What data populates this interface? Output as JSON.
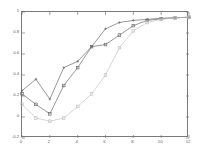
{
  "chart_data": {
    "type": "line",
    "title": "",
    "subtitle": "",
    "xlabel": "",
    "ylabel": "",
    "xlim": [
      0,
      12
    ],
    "ylim": [
      -0.2,
      1
    ],
    "grid": false,
    "legend": "none",
    "background_color": "#ffffff",
    "frame_color": "#7a7a7a",
    "xticks": [
      0,
      2,
      4,
      6,
      8,
      10,
      12
    ],
    "xtick_labels": [
      "0",
      "2",
      "4",
      "6",
      "8",
      "10",
      "12"
    ],
    "yticks": [
      -0.2,
      0,
      0.2,
      0.4,
      0.6,
      0.8,
      1
    ],
    "ytick_labels": [
      "-0.2",
      "0",
      "0.2",
      "0.4",
      "0.6",
      "0.8",
      "1"
    ],
    "x": [
      0,
      1,
      2,
      3,
      4,
      5,
      6,
      7,
      8,
      9,
      10,
      11,
      12
    ],
    "series": [
      {
        "name": "series-1",
        "color": "#6b6b6b",
        "marker": "plus",
        "marker_size": 2.6,
        "line_width": 0.7,
        "values": [
          0.25,
          0.36,
          0.17,
          0.47,
          0.53,
          0.67,
          0.84,
          0.9,
          0.92,
          0.93,
          0.94,
          0.945,
          0.95
        ]
      },
      {
        "name": "series-2",
        "color": "#6b6b6b",
        "marker": "square",
        "marker_size": 2.6,
        "line_width": 0.7,
        "values": [
          0.22,
          0.12,
          0.03,
          0.3,
          0.47,
          0.67,
          0.69,
          0.78,
          0.87,
          0.92,
          0.935,
          0.945,
          0.95
        ]
      },
      {
        "name": "series-3",
        "color": "#c4c4c4",
        "marker": "square",
        "marker_size": 2.6,
        "line_width": 0.7,
        "values": [
          0.12,
          -0.01,
          -0.04,
          -0.01,
          0.1,
          0.22,
          0.4,
          0.66,
          0.82,
          0.9,
          0.93,
          0.945,
          0.95
        ]
      }
    ]
  }
}
